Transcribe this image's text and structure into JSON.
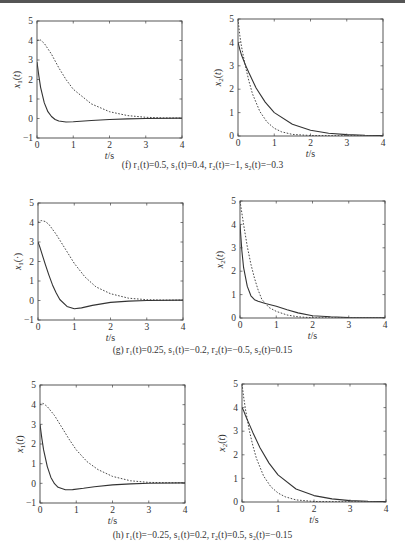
{
  "chart_data": [
    {
      "id": "f-left",
      "type": "line",
      "xlabel": "t/s",
      "ylabel": "x1(t)",
      "ylabel_sub": "1",
      "xlim": [
        0,
        4
      ],
      "ylim": [
        -1,
        5
      ],
      "xticks": [
        0,
        1,
        2,
        3,
        4
      ],
      "yticks": [
        -1,
        0,
        1,
        2,
        3,
        4,
        5
      ],
      "frame": {
        "x0": 37,
        "y0": 21,
        "x1": 182,
        "y1": 138
      },
      "series": [
        {
          "name": "solid",
          "style": "solid",
          "x": [
            0,
            0.05,
            0.1,
            0.2,
            0.3,
            0.4,
            0.5,
            0.6,
            0.8,
            1.0,
            1.5,
            2.0,
            2.5,
            3.0,
            4.0
          ],
          "y": [
            2.9,
            2.2,
            1.6,
            0.8,
            0.35,
            0.1,
            -0.05,
            -0.13,
            -0.18,
            -0.17,
            -0.1,
            -0.05,
            -0.02,
            0.0,
            0.02
          ]
        },
        {
          "name": "dashed",
          "style": "dashed",
          "x": [
            0,
            0.05,
            0.1,
            0.2,
            0.4,
            0.6,
            0.8,
            1.0,
            1.5,
            2.0,
            2.5,
            3.0,
            3.5,
            4.0
          ],
          "y": [
            4.0,
            4.05,
            4.02,
            3.85,
            3.3,
            2.6,
            2.0,
            1.5,
            0.75,
            0.35,
            0.15,
            0.06,
            0.03,
            0.02
          ]
        }
      ]
    },
    {
      "id": "f-right",
      "type": "line",
      "xlabel": "t/s",
      "ylabel": "x2(t)",
      "ylabel_sub": "2",
      "xlim": [
        0,
        4
      ],
      "ylim": [
        0,
        5
      ],
      "xticks": [
        0,
        1,
        2,
        3,
        4
      ],
      "yticks": [
        0,
        1,
        2,
        3,
        4,
        5
      ],
      "frame": {
        "x0": 238,
        "y0": 19,
        "x1": 383,
        "y1": 136
      },
      "series": [
        {
          "name": "solid",
          "style": "solid",
          "x": [
            0,
            0.05,
            0.1,
            0.2,
            0.3,
            0.5,
            0.75,
            1.0,
            1.5,
            2.0,
            2.5,
            3.0,
            3.5,
            4.0
          ],
          "y": [
            4.0,
            3.7,
            3.45,
            3.05,
            2.7,
            2.05,
            1.45,
            1.0,
            0.5,
            0.25,
            0.12,
            0.06,
            0.03,
            0.02
          ]
        },
        {
          "name": "dashed",
          "style": "dashed",
          "x": [
            0,
            0.05,
            0.1,
            0.2,
            0.3,
            0.4,
            0.6,
            0.8,
            1.0,
            1.2,
            1.5,
            2.0,
            4.0
          ],
          "y": [
            5.0,
            4.3,
            3.8,
            3.0,
            2.35,
            1.8,
            1.05,
            0.6,
            0.33,
            0.18,
            0.07,
            0.02,
            0.0
          ]
        }
      ]
    },
    {
      "id": "g-left",
      "type": "line",
      "xlabel": "t/s",
      "ylabel": "x1(·)",
      "ylabel_sub": "1",
      "xlim": [
        0,
        4
      ],
      "ylim": [
        -1,
        5
      ],
      "xticks": [
        0,
        1,
        2,
        3,
        4
      ],
      "yticks": [
        -1,
        0,
        1,
        2,
        3,
        4,
        5
      ],
      "frame": {
        "x0": 38,
        "y0": 203,
        "x1": 183,
        "y1": 320
      },
      "series": [
        {
          "name": "solid",
          "style": "solid",
          "x": [
            0,
            0.05,
            0.1,
            0.2,
            0.3,
            0.4,
            0.5,
            0.6,
            0.8,
            1.0,
            1.2,
            1.5,
            2.0,
            2.5,
            3.0,
            4.0
          ],
          "y": [
            3.0,
            2.75,
            2.45,
            1.85,
            1.3,
            0.8,
            0.4,
            0.05,
            -0.3,
            -0.42,
            -0.38,
            -0.25,
            -0.1,
            -0.03,
            0.0,
            0.02
          ]
        },
        {
          "name": "dashed",
          "style": "dashed",
          "x": [
            0,
            0.05,
            0.1,
            0.2,
            0.3,
            0.5,
            0.7,
            1.0,
            1.3,
            1.6,
            2.0,
            2.5,
            3.0,
            3.5,
            4.0
          ],
          "y": [
            4.0,
            4.08,
            4.1,
            4.05,
            3.9,
            3.4,
            2.8,
            1.9,
            1.2,
            0.7,
            0.35,
            0.12,
            0.04,
            0.02,
            0.02
          ]
        }
      ]
    },
    {
      "id": "g-right",
      "type": "line",
      "xlabel": "t/s",
      "ylabel": "x2(t)",
      "ylabel_sub": "2",
      "xlim": [
        0,
        4
      ],
      "ylim": [
        0,
        5
      ],
      "xticks": [
        0,
        1,
        2,
        3,
        4
      ],
      "yticks": [
        0,
        1,
        2,
        3,
        4,
        5
      ],
      "frame": {
        "x0": 240,
        "y0": 201,
        "x1": 385,
        "y1": 318
      },
      "series": [
        {
          "name": "solid",
          "style": "solid",
          "x": [
            0,
            0.05,
            0.1,
            0.2,
            0.3,
            0.4,
            0.5,
            0.7,
            1.0,
            1.3,
            1.6,
            2.0,
            2.5,
            3.0,
            4.0
          ],
          "y": [
            4.0,
            2.9,
            2.15,
            1.35,
            0.95,
            0.78,
            0.72,
            0.62,
            0.5,
            0.35,
            0.22,
            0.1,
            0.05,
            0.02,
            0.01
          ]
        },
        {
          "name": "dashed",
          "style": "dashed",
          "x": [
            0,
            0.05,
            0.1,
            0.2,
            0.3,
            0.4,
            0.5,
            0.6,
            0.8,
            1.0,
            1.3,
            1.6,
            2.0,
            4.0
          ],
          "y": [
            5.0,
            4.5,
            4.0,
            3.05,
            2.3,
            1.7,
            1.2,
            0.8,
            0.45,
            0.28,
            0.13,
            0.05,
            0.01,
            0.0
          ]
        }
      ]
    },
    {
      "id": "h-left",
      "type": "line",
      "xlabel": "t/s",
      "ylabel": "x1(t)",
      "ylabel_sub": "1",
      "xlim": [
        0,
        4
      ],
      "ylim": [
        -1,
        5
      ],
      "xticks": [
        0,
        1,
        2,
        3,
        4
      ],
      "yticks": [
        -1,
        0,
        1,
        2,
        3,
        4,
        5
      ],
      "frame": {
        "x0": 40,
        "y0": 385,
        "x1": 185,
        "y1": 503
      },
      "series": [
        {
          "name": "solid",
          "style": "solid",
          "x": [
            0,
            0.05,
            0.1,
            0.2,
            0.3,
            0.4,
            0.5,
            0.7,
            0.9,
            1.2,
            1.5,
            2.0,
            2.5,
            3.0,
            4.0
          ],
          "y": [
            3.0,
            2.3,
            1.7,
            0.85,
            0.3,
            -0.02,
            -0.2,
            -0.33,
            -0.32,
            -0.25,
            -0.17,
            -0.08,
            -0.03,
            0.0,
            0.02
          ]
        },
        {
          "name": "dashed",
          "style": "dashed",
          "x": [
            0,
            0.05,
            0.1,
            0.2,
            0.4,
            0.6,
            0.8,
            1.0,
            1.3,
            1.6,
            2.0,
            2.5,
            3.0,
            3.5,
            4.0
          ],
          "y": [
            4.0,
            4.08,
            4.05,
            3.9,
            3.45,
            2.85,
            2.25,
            1.7,
            1.1,
            0.7,
            0.35,
            0.13,
            0.05,
            0.03,
            0.02
          ]
        }
      ]
    },
    {
      "id": "h-right",
      "type": "line",
      "xlabel": "t/s",
      "ylabel": "x2(t)",
      "ylabel_sub": "2",
      "xlim": [
        0,
        4
      ],
      "ylim": [
        0,
        5
      ],
      "xticks": [
        0,
        1,
        2,
        3,
        4
      ],
      "yticks": [
        0,
        1,
        2,
        3,
        4,
        5
      ],
      "frame": {
        "x0": 242,
        "y0": 384,
        "x1": 386,
        "y1": 502
      },
      "series": [
        {
          "name": "solid",
          "style": "solid",
          "x": [
            0,
            0.05,
            0.1,
            0.2,
            0.3,
            0.5,
            0.75,
            1.0,
            1.5,
            2.0,
            2.5,
            3.0,
            3.5,
            4.0
          ],
          "y": [
            4.0,
            3.85,
            3.65,
            3.3,
            2.95,
            2.3,
            1.65,
            1.15,
            0.55,
            0.27,
            0.13,
            0.06,
            0.03,
            0.02
          ]
        },
        {
          "name": "dashed",
          "style": "dashed",
          "x": [
            0,
            0.05,
            0.1,
            0.2,
            0.3,
            0.4,
            0.6,
            0.8,
            1.0,
            1.2,
            1.5,
            2.0,
            4.0
          ],
          "y": [
            5.0,
            4.4,
            3.9,
            3.05,
            2.4,
            1.85,
            1.1,
            0.65,
            0.38,
            0.22,
            0.09,
            0.02,
            0.0
          ]
        }
      ]
    }
  ],
  "captions": {
    "f": "(f) r₁(t)=0.5, s₁(t)=0.4, r₂(t)=−1, s₂(t)=−0.3",
    "g": "(g) r₁(t)=0.25, s₁(t)=−0.2, r₂(t)=−0.5, s₂(t)=0.15",
    "h": "(h) r₁(t)=−0.25, s₁(t)=0.2, r₂(t)=0.5, s₂(t)=−0.15"
  }
}
